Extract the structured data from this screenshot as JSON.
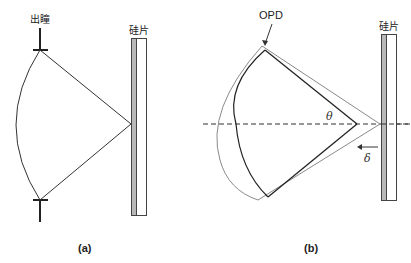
{
  "panels": [
    {
      "id": "a",
      "caption": "(a)",
      "labels": {
        "top_marker": "出瞳",
        "slab": "硅片"
      }
    },
    {
      "id": "b",
      "caption": "(b)",
      "labels": {
        "opd": "OPD",
        "slab": "硅片",
        "angle": "θ",
        "shift": "δ"
      }
    }
  ],
  "colors": {
    "line_dark": "#222222",
    "line_gray": "#8a8a8a",
    "slab_fill": "#b8b8b8",
    "slab_border": "#444444"
  }
}
